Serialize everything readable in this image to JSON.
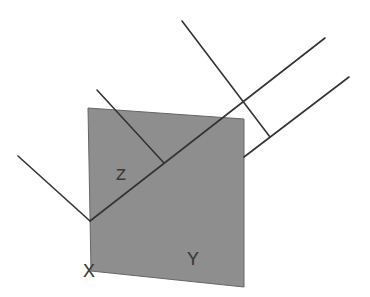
{
  "diagram": {
    "plane": {
      "points": [
        [
          88,
          108
        ],
        [
          244,
          119
        ],
        [
          244,
          287
        ],
        [
          91,
          271
        ]
      ],
      "fill": "#8e8e8e",
      "stroke": "#555555"
    },
    "line_color": "#333333",
    "lines": [
      {
        "name": "incident-ray",
        "x1": 18,
        "y1": 156,
        "x2": 90,
        "y2": 221
      },
      {
        "name": "main-diagonal",
        "x1": 90,
        "y1": 221,
        "x2": 325,
        "y2": 38
      },
      {
        "name": "short-perpendicular",
        "x1": 97,
        "y1": 90,
        "x2": 164,
        "y2": 163
      },
      {
        "name": "lower-parallel",
        "x1": 244,
        "y1": 157,
        "x2": 349,
        "y2": 77
      },
      {
        "name": "long-perpendicular",
        "x1": 182,
        "y1": 21,
        "x2": 270,
        "y2": 137
      }
    ],
    "labels": {
      "z": "z",
      "y": "Y",
      "x": "X"
    }
  }
}
